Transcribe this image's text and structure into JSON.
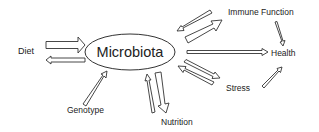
{
  "diagram": {
    "center": {
      "label": "Microbiota"
    },
    "nodes": {
      "diet": "Diet",
      "genotype": "Genotype",
      "nutrition": "Nutrition",
      "immune": "Immune Function",
      "health": "Health",
      "stress": "Stress"
    },
    "edges": [
      {
        "from": "Diet",
        "to": "Microbiota",
        "style": "large"
      },
      {
        "from": "Microbiota",
        "to": "Diet",
        "style": "small"
      },
      {
        "from": "Genotype",
        "to": "Microbiota",
        "style": "small"
      },
      {
        "from": "Nutrition",
        "to": "Microbiota",
        "style": "small"
      },
      {
        "from": "Microbiota",
        "to": "Nutrition",
        "style": "large"
      },
      {
        "from": "Immune Function",
        "to": "Microbiota",
        "style": "small"
      },
      {
        "from": "Microbiota",
        "to": "Immune Function",
        "style": "large"
      },
      {
        "from": "Microbiota",
        "to": "Health",
        "style": "small"
      },
      {
        "from": "Stress",
        "to": "Microbiota",
        "style": "small"
      },
      {
        "from": "Microbiota",
        "to": "Stress",
        "style": "small"
      },
      {
        "from": "Immune Function",
        "to": "Health",
        "style": "line"
      },
      {
        "from": "Stress",
        "to": "Health",
        "style": "line"
      }
    ],
    "colors": {
      "stroke": "#333333",
      "text": "#222222",
      "background": "#ffffff"
    }
  }
}
